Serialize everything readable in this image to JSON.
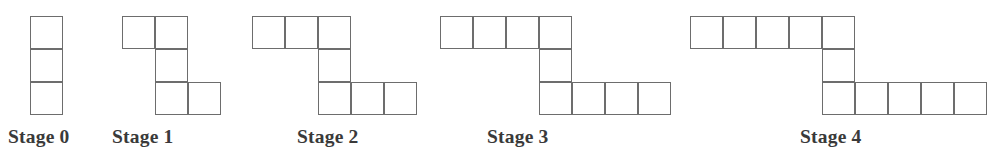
{
  "figure": {
    "background_color": "#ffffff",
    "line_color": "#6d6d6d",
    "label_color": "#3a3a3a",
    "cell_width": 33,
    "cell_height": 33,
    "rows_per_stage": 3,
    "stages": [
      {
        "label": "Stage 0",
        "index": 0,
        "top_row_count": 1,
        "middle_row_count": 1,
        "bottom_row_count": 1,
        "total_squares": 3,
        "group_left": 30,
        "group_top": 16,
        "label_left": 8,
        "label_top": 127
      },
      {
        "label": "Stage 1",
        "index": 1,
        "top_row_count": 2,
        "middle_row_count": 1,
        "bottom_row_count": 2,
        "total_squares": 5,
        "group_left": 122,
        "group_top": 16,
        "label_left": 112,
        "label_top": 127
      },
      {
        "label": "Stage 2",
        "index": 2,
        "top_row_count": 3,
        "middle_row_count": 1,
        "bottom_row_count": 3,
        "total_squares": 7,
        "group_left": 252,
        "group_top": 16,
        "label_left": 297,
        "label_top": 127
      },
      {
        "label": "Stage 3",
        "index": 3,
        "top_row_count": 4,
        "middle_row_count": 1,
        "bottom_row_count": 4,
        "total_squares": 9,
        "group_left": 440,
        "group_top": 16,
        "label_left": 487,
        "label_top": 127
      },
      {
        "label": "Stage 4",
        "index": 4,
        "top_row_count": 5,
        "middle_row_count": 1,
        "bottom_row_count": 5,
        "total_squares": 11,
        "group_left": 690,
        "group_top": 16,
        "label_left": 800,
        "label_top": 127
      }
    ]
  }
}
